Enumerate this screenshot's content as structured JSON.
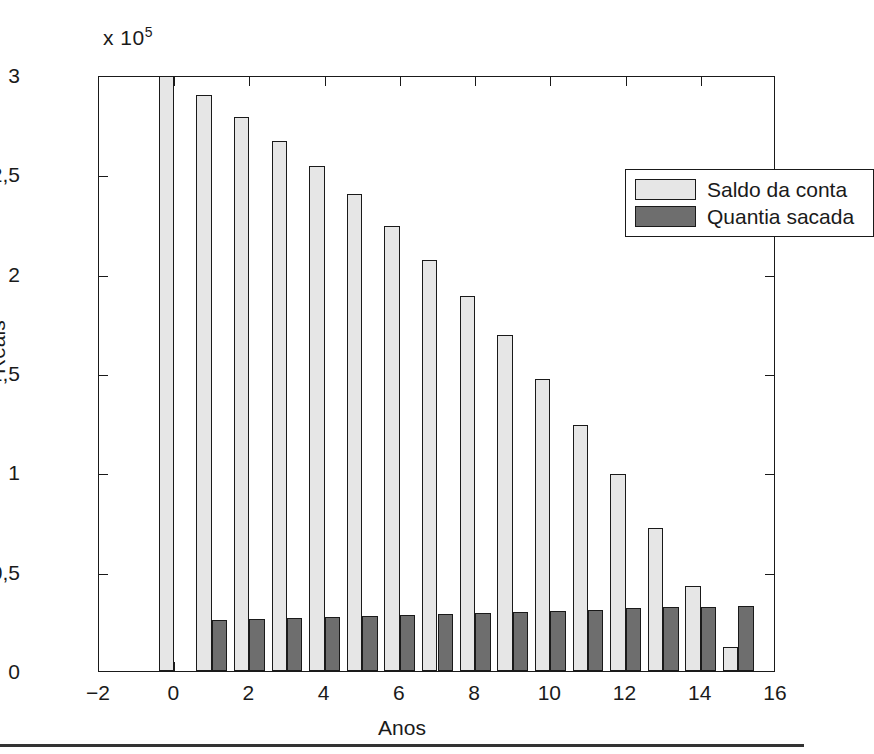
{
  "chart_data": {
    "type": "bar",
    "title": "",
    "xlabel": "Anos",
    "ylabel": "Reais",
    "y_exponent_label": "x 10",
    "y_exponent_power": "5",
    "y_multiplier": 100000,
    "xlim": [
      -2,
      16
    ],
    "ylim": [
      0,
      3
    ],
    "grid": false,
    "legend_position": "upper right",
    "x_ticks": [
      "-2",
      "0",
      "2",
      "4",
      "6",
      "8",
      "10",
      "12",
      "14",
      "16"
    ],
    "x_tick_values": [
      -2,
      0,
      2,
      4,
      6,
      8,
      10,
      12,
      14,
      16
    ],
    "y_ticks": [
      "0",
      "0,5",
      "1",
      "1,5",
      "2",
      "2,5",
      "3"
    ],
    "y_tick_values": [
      0,
      0.5,
      1,
      1.5,
      2,
      2.5,
      3
    ],
    "categories": [
      0,
      1,
      2,
      3,
      4,
      5,
      6,
      7,
      8,
      9,
      10,
      11,
      12,
      13,
      14,
      15
    ],
    "series": [
      {
        "name": "Saldo da conta",
        "color": "#e6e6e6",
        "values": [
          3.0,
          2.9,
          2.79,
          2.67,
          2.54,
          2.4,
          2.24,
          2.07,
          1.89,
          1.69,
          1.47,
          1.24,
          0.99,
          0.72,
          0.43,
          0.12
        ]
      },
      {
        "name": "Quantia sacada",
        "color": "#6e6e6e",
        "values": [
          0.0,
          0.255,
          0.26,
          0.265,
          0.27,
          0.275,
          0.281,
          0.286,
          0.291,
          0.297,
          0.303,
          0.309,
          0.315,
          0.321,
          0.32,
          0.327
        ]
      }
    ],
    "legend": [
      {
        "label": "Saldo da conta",
        "swatch": "light"
      },
      {
        "label": "Quantia sacada",
        "swatch": "dark"
      }
    ]
  }
}
